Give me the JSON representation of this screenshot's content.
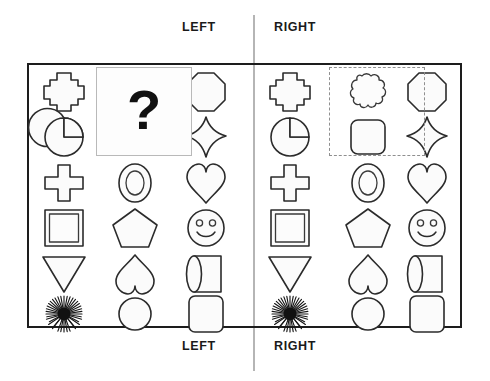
{
  "labels": {
    "left_top": "LEFT",
    "right_top": "RIGHT",
    "left_bottom": "LEFT",
    "right_bottom": "RIGHT"
  },
  "question": {
    "mark": "?"
  },
  "colors": {
    "shape_stroke": "#2b2b2b",
    "shape_fill": "#fbfbfb",
    "frame_border": "#1d1d1d",
    "midline": "#b5b5b5",
    "dashed_box": "#8f8f8f",
    "question_mark": "#111111",
    "text": "#1a1a1a"
  },
  "panels": {
    "left": {
      "name": "LEFT",
      "columns": [
        {
          "index": 1,
          "shapes": [
            "thick-cross",
            "pac-man",
            "thin-cross",
            "double-square",
            "down-triangle",
            "sunburst"
          ]
        },
        {
          "index": 2,
          "shapes": [
            "hidden-by-question-box",
            "hidden-by-question-box",
            "oval-ring",
            "pentagon",
            "inverted-heart",
            "circle"
          ]
        },
        {
          "index": 3,
          "shapes": [
            "octagon",
            "four-point-star",
            "heart",
            "smiley-face",
            "cylinder",
            "rounded-square"
          ]
        }
      ],
      "overlay": "question-box"
    },
    "right": {
      "name": "RIGHT",
      "columns": [
        {
          "index": 1,
          "shapes": [
            "thick-cross",
            "pac-man",
            "thin-cross",
            "double-square",
            "down-triangle",
            "sunburst"
          ]
        },
        {
          "index": 2,
          "shapes": [
            "cloud-blob",
            "rounded-square",
            "oval-ring",
            "pentagon",
            "inverted-heart",
            "circle"
          ]
        },
        {
          "index": 3,
          "shapes": [
            "octagon",
            "four-point-star",
            "heart",
            "smiley-face",
            "cylinder",
            "rounded-square"
          ]
        }
      ],
      "overlay": "dashed-answer-box"
    }
  },
  "grid": {
    "rows": 6,
    "columns_per_panel": 3
  }
}
